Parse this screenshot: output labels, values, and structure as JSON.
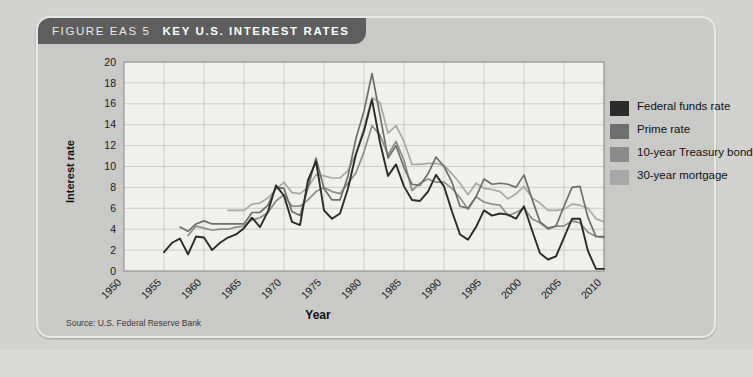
{
  "figure": {
    "label": "FIGURE EAS 5",
    "title": "KEY U.S. INTEREST RATES",
    "source": "Source: U.S. Federal Reserve Bank"
  },
  "colors": {
    "panel_bg": "#c9c9c7",
    "header_bg": "#5e5e5e",
    "plot_bg": "#f0f0ee",
    "grid": "#c3c3c1",
    "federal_funds_rate": "#2b2b2b",
    "prime_rate": "#6e6e6e",
    "treasury_10yr": "#8c8c8c",
    "mortgage_30yr": "#a8a8a8"
  },
  "legend": {
    "position": "right",
    "items": [
      {
        "label": "Federal funds rate",
        "color": "#2b2b2b"
      },
      {
        "label": "Prime rate",
        "color": "#6e6e6e"
      },
      {
        "label": "10-year Treasury bond",
        "color": "#8c8c8c"
      },
      {
        "label": "30-year mortgage",
        "color": "#a8a8a8"
      }
    ]
  },
  "chart_data": {
    "type": "line",
    "title": "KEY U.S. INTEREST RATES",
    "xlabel": "Year",
    "ylabel": "Interest rate",
    "xlim": [
      1950,
      2010
    ],
    "ylim": [
      0,
      20
    ],
    "xticks": [
      1950,
      1955,
      1960,
      1965,
      1970,
      1975,
      1980,
      1985,
      1990,
      1995,
      2000,
      2005,
      2010
    ],
    "yticks": [
      0,
      2,
      4,
      6,
      8,
      10,
      12,
      14,
      16,
      18,
      20
    ],
    "grid": true,
    "xtick_rotation": -45,
    "series": [
      {
        "name": "Federal funds rate",
        "color": "#2b2b2b",
        "x": [
          1955,
          1956,
          1957,
          1958,
          1959,
          1960,
          1961,
          1962,
          1963,
          1964,
          1965,
          1966,
          1967,
          1968,
          1969,
          1970,
          1971,
          1972,
          1973,
          1974,
          1975,
          1976,
          1977,
          1978,
          1979,
          1980,
          1981,
          1982,
          1983,
          1984,
          1985,
          1986,
          1987,
          1988,
          1989,
          1990,
          1991,
          1992,
          1993,
          1994,
          1995,
          1996,
          1997,
          1998,
          1999,
          2000,
          2001,
          2002,
          2003,
          2004,
          2005,
          2006,
          2007,
          2008,
          2009,
          2010
        ],
        "values": [
          1.8,
          2.7,
          3.1,
          1.6,
          3.3,
          3.2,
          2.0,
          2.7,
          3.2,
          3.5,
          4.1,
          5.1,
          4.2,
          5.7,
          8.2,
          7.2,
          4.7,
          4.4,
          8.7,
          10.5,
          5.8,
          5.0,
          5.5,
          7.9,
          11.2,
          13.4,
          16.4,
          12.3,
          9.1,
          10.2,
          8.1,
          6.8,
          6.7,
          7.6,
          9.2,
          8.1,
          5.7,
          3.5,
          3.0,
          4.2,
          5.8,
          5.3,
          5.5,
          5.4,
          5.0,
          6.2,
          3.9,
          1.7,
          1.1,
          1.4,
          3.2,
          5.0,
          5.0,
          1.9,
          0.2,
          0.2
        ]
      },
      {
        "name": "Prime rate",
        "color": "#6e6e6e",
        "x": [
          1957,
          1958,
          1959,
          1960,
          1961,
          1962,
          1963,
          1964,
          1965,
          1966,
          1967,
          1968,
          1969,
          1970,
          1971,
          1972,
          1973,
          1974,
          1975,
          1976,
          1977,
          1978,
          1979,
          1980,
          1981,
          1982,
          1983,
          1984,
          1985,
          1986,
          1987,
          1988,
          1989,
          1990,
          1991,
          1992,
          1993,
          1994,
          1995,
          1996,
          1997,
          1998,
          1999,
          2000,
          2001,
          2002,
          2003,
          2004,
          2005,
          2006,
          2007,
          2008,
          2009,
          2010
        ],
        "values": [
          4.2,
          3.8,
          4.5,
          4.8,
          4.5,
          4.5,
          4.5,
          4.5,
          4.5,
          5.6,
          5.6,
          6.3,
          8.0,
          7.9,
          5.7,
          5.3,
          8.0,
          10.8,
          7.9,
          6.8,
          6.8,
          9.1,
          12.7,
          15.3,
          18.9,
          14.9,
          10.8,
          12.0,
          9.9,
          8.3,
          8.2,
          9.3,
          10.9,
          10.0,
          8.5,
          6.2,
          6.0,
          7.1,
          8.8,
          8.3,
          8.4,
          8.3,
          8.0,
          9.2,
          6.9,
          4.7,
          4.1,
          4.3,
          6.2,
          8.0,
          8.1,
          5.1,
          3.3,
          3.3
        ]
      },
      {
        "name": "10-year Treasury bond",
        "color": "#8c8c8c",
        "x": [
          1958,
          1959,
          1960,
          1961,
          1962,
          1963,
          1964,
          1965,
          1966,
          1967,
          1968,
          1969,
          1970,
          1971,
          1972,
          1973,
          1974,
          1975,
          1976,
          1977,
          1978,
          1979,
          1980,
          1981,
          1982,
          1983,
          1984,
          1985,
          1986,
          1987,
          1988,
          1989,
          1990,
          1991,
          1992,
          1993,
          1994,
          1995,
          1996,
          1997,
          1998,
          1999,
          2000,
          2001,
          2002,
          2003,
          2004,
          2005,
          2006,
          2007,
          2008,
          2009,
          2010
        ],
        "values": [
          3.4,
          4.3,
          4.1,
          3.9,
          4.0,
          4.0,
          4.2,
          4.3,
          4.9,
          5.1,
          5.6,
          6.7,
          7.3,
          6.2,
          6.2,
          6.8,
          7.6,
          8.0,
          7.6,
          7.4,
          8.4,
          9.4,
          11.4,
          13.9,
          13.0,
          11.1,
          12.4,
          10.6,
          7.7,
          8.4,
          8.8,
          8.5,
          8.5,
          7.9,
          7.0,
          5.9,
          7.1,
          6.6,
          6.4,
          6.3,
          5.3,
          5.6,
          6.0,
          5.0,
          4.6,
          4.0,
          4.3,
          4.3,
          4.8,
          4.6,
          3.7,
          3.3,
          3.2
        ]
      },
      {
        "name": "30-year mortgage",
        "color": "#a8a8a8",
        "x": [
          1963,
          1964,
          1965,
          1966,
          1967,
          1968,
          1969,
          1970,
          1971,
          1972,
          1973,
          1974,
          1975,
          1976,
          1977,
          1978,
          1979,
          1980,
          1981,
          1982,
          1983,
          1984,
          1985,
          1986,
          1987,
          1988,
          1989,
          1990,
          1991,
          1992,
          1993,
          1994,
          1995,
          1996,
          1997,
          1998,
          1999,
          2000,
          2001,
          2002,
          2003,
          2004,
          2005,
          2006,
          2007,
          2008,
          2009,
          2010
        ],
        "values": [
          5.8,
          5.8,
          5.8,
          6.4,
          6.5,
          7.0,
          7.8,
          8.5,
          7.5,
          7.4,
          8.0,
          9.2,
          9.1,
          8.9,
          8.9,
          9.6,
          11.2,
          13.7,
          16.6,
          16.1,
          13.2,
          13.9,
          12.4,
          10.2,
          10.2,
          10.3,
          10.3,
          10.1,
          9.3,
          8.4,
          7.3,
          8.4,
          7.9,
          7.8,
          7.6,
          6.9,
          7.4,
          8.1,
          7.0,
          6.5,
          5.8,
          5.8,
          5.9,
          6.4,
          6.3,
          6.0,
          5.0,
          4.7
        ]
      }
    ]
  }
}
